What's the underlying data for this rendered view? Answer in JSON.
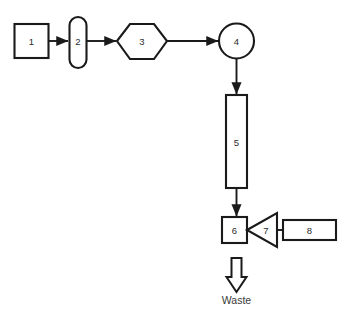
{
  "diagram": {
    "background_color": "#ffffff",
    "line_color": "#1a1a1a",
    "label_color": "#2b2b2b",
    "nodes": [
      {
        "id": "n1",
        "label": "1",
        "shape": "rectangle"
      },
      {
        "id": "n2",
        "label": "2",
        "shape": "vertical-capsule"
      },
      {
        "id": "n3",
        "label": "3",
        "shape": "hexagon"
      },
      {
        "id": "n4",
        "label": "4",
        "shape": "circle"
      },
      {
        "id": "n5",
        "label": "5",
        "shape": "tall-column"
      },
      {
        "id": "n6",
        "label": "6",
        "shape": "small-square"
      },
      {
        "id": "n7",
        "label": "7",
        "shape": "left-pointing-triangle"
      },
      {
        "id": "n8",
        "label": "8",
        "shape": "horizontal-rectangle"
      }
    ],
    "outlet": {
      "label": "Waste",
      "arrow_direction": "down",
      "arrow_style": "hollow-block-arrow"
    }
  }
}
